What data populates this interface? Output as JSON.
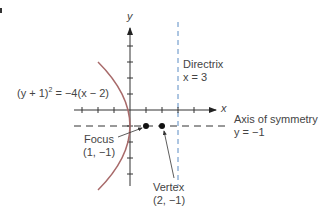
{
  "diagram": {
    "type": "parabola-graph",
    "axes": {
      "x_label": "x",
      "y_label": "y",
      "origin_px": [
        130,
        110
      ],
      "unit_px": 16,
      "x_ticks": [
        -3,
        -2,
        -1,
        1,
        2,
        3,
        4
      ],
      "y_ticks": [
        -5,
        -4,
        -3,
        -2,
        -1,
        1,
        2,
        3,
        4
      ]
    },
    "equation": {
      "text_left": "(y + 1)",
      "exponent": "2",
      "text_right": " = −4(x − 2)"
    },
    "directrix": {
      "title": "Directrix",
      "equation": "x = 3",
      "value": 3,
      "color": "#5b8cc4"
    },
    "axis_of_symmetry": {
      "title": "Axis of symmetry",
      "equation": "y = −1",
      "value": -1
    },
    "focus": {
      "title": "Focus",
      "coords": "(1, −1)",
      "point": [
        1,
        -1
      ]
    },
    "vertex": {
      "title": "Vertex",
      "coords": "(2, −1)",
      "point": [
        2,
        -1
      ]
    },
    "colors": {
      "parabola": "#a86a6a",
      "axes": "#333333",
      "text": "#444444",
      "points": "#111111"
    }
  }
}
